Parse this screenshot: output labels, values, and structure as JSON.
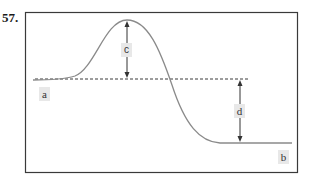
{
  "question": {
    "number": "57."
  },
  "diagram": {
    "type": "energy-profile",
    "labels": {
      "a": "a",
      "b": "b",
      "c": "c",
      "d": "d"
    },
    "colors": {
      "frame": "#3a3a3a",
      "curve": "#8a8a8a",
      "dashed_line": "#3a3a3a",
      "arrows": "#333333",
      "label_bg": "#e8e8e8"
    }
  }
}
